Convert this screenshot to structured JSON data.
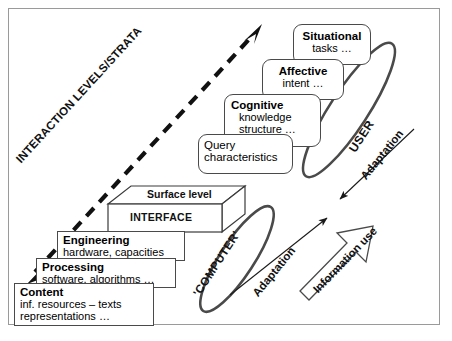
{
  "diagram": {
    "axis_label": "INTERACTION LEVELS/STRATA",
    "user_ellipse_label": "USER",
    "computer_ellipse_label": "'COMPUTER'",
    "adaptation_upper_label": "Adaptation",
    "adaptation_lower_label": "Adaptation",
    "information_use_label": "Information use",
    "border_color": "#9a9a9a",
    "line_color": "#3a3a3a",
    "text_color": "#111111"
  },
  "user_boxes": [
    {
      "name": "situational",
      "heading": "Situational",
      "line2": "tasks …",
      "line3": ""
    },
    {
      "name": "affective",
      "heading": "Affective",
      "line2": "intent …",
      "line3": ""
    },
    {
      "name": "cognitive",
      "heading": "Cognitive",
      "line2": "knowledge",
      "line3": "structure …"
    },
    {
      "name": "query",
      "heading": "Query",
      "line2": "characteristics",
      "line3": ""
    }
  ],
  "interface_box": {
    "top_label": "Surface level",
    "front_label": "INTERFACE"
  },
  "computer_boxes": [
    {
      "name": "engineering",
      "heading": "Engineering",
      "line2": "hardware, capacities",
      "line3": ""
    },
    {
      "name": "processing",
      "heading": "Processing",
      "line2": "software, algorithms …",
      "line3": ""
    },
    {
      "name": "content",
      "heading": "Content",
      "line2": "inf. resources – texts",
      "line3": "representations …"
    }
  ]
}
